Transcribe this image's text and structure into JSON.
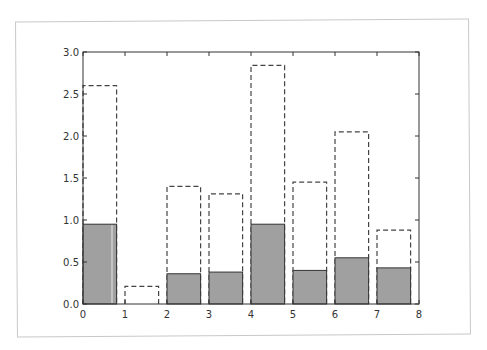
{
  "chart_data": {
    "type": "bar",
    "title": "",
    "xlabel": "",
    "ylabel": "",
    "xlim": [
      0,
      8
    ],
    "ylim": [
      0,
      3.0
    ],
    "grid": false,
    "legend": null,
    "bar_width": 0.8,
    "x": [
      0,
      1,
      2,
      3,
      4,
      5,
      6,
      7
    ],
    "series": [
      {
        "name": "total (dashed outline)",
        "style": "dashed-outline",
        "values": [
          2.6,
          0.21,
          1.4,
          1.31,
          2.84,
          1.45,
          2.05,
          0.88
        ]
      },
      {
        "name": "filled (gray)",
        "style": "solid-fill",
        "color": "#a0a0a0",
        "values": [
          0.95,
          0.0,
          0.36,
          0.38,
          0.95,
          0.4,
          0.55,
          0.43
        ]
      }
    ],
    "x_ticks": [
      "0",
      "1",
      "2",
      "3",
      "4",
      "5",
      "6",
      "7",
      "8"
    ],
    "y_ticks": [
      "0.0",
      "0.5",
      "1.0",
      "1.5",
      "2.0",
      "2.5",
      "3.0"
    ]
  },
  "colors": {
    "bar_fill": "#a0a0a0",
    "bar_edge": "#333333",
    "dashed_edge": "#444444",
    "axes": "#333333",
    "frame": "#c8c8c8"
  }
}
